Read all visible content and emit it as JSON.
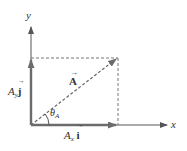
{
  "diagram": {
    "type": "vector-components",
    "axes": {
      "x_label": "x",
      "y_label": "y"
    },
    "vector": {
      "label": "A",
      "arrow": "→"
    },
    "angle": {
      "symbol": "θ",
      "subscript": "A"
    },
    "x_component": {
      "coef": "A",
      "sub": "x",
      "unit": "i",
      "arrow": "→"
    },
    "y_component": {
      "coef": "A",
      "sub": "y",
      "unit": "j",
      "arrow": "→"
    },
    "colors": {
      "component": "#6b6b6b",
      "axis": "#555555",
      "dashed": "#777777",
      "text": "#333333"
    }
  }
}
